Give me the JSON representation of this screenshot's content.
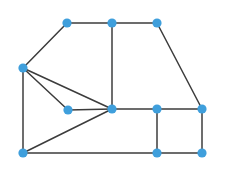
{
  "figure": {
    "background_color": "#ffffff",
    "width": 225,
    "height": 171
  },
  "style": {
    "node_color": "#3f9fdc",
    "node_radius": 4.6,
    "edge_color": "#3c3c3c",
    "edge_width": 1.5
  },
  "chart_data": {
    "type": "scatter",
    "xlabel": "",
    "ylabel": "",
    "grid": false,
    "legend": "none",
    "xlim": [
      0,
      225
    ],
    "ylim": [
      0,
      171
    ],
    "node_count": 11,
    "edge_count": 17,
    "nodes": [
      {
        "id": "n1",
        "label": "top-left",
        "x": 67,
        "y": 23
      },
      {
        "id": "n2",
        "label": "top-middle",
        "x": 112,
        "y": 23
      },
      {
        "id": "n3",
        "label": "top-right",
        "x": 157,
        "y": 23
      },
      {
        "id": "n4",
        "label": "left-apex",
        "x": 23,
        "y": 68
      },
      {
        "id": "n5",
        "label": "inner",
        "x": 68,
        "y": 110
      },
      {
        "id": "n6",
        "label": "center-hub",
        "x": 112,
        "y": 109
      },
      {
        "id": "n7",
        "label": "mid-right",
        "x": 157,
        "y": 109
      },
      {
        "id": "n8",
        "label": "far-right",
        "x": 202,
        "y": 109
      },
      {
        "id": "n9",
        "label": "bottom-left",
        "x": 23,
        "y": 153
      },
      {
        "id": "n10",
        "label": "bottom-middle",
        "x": 157,
        "y": 153
      },
      {
        "id": "n11",
        "label": "bottom-right",
        "x": 202,
        "y": 153
      }
    ],
    "edges": [
      {
        "source": "n1",
        "target": "n2",
        "x1": 67,
        "y1": 23,
        "x2": 112,
        "y2": 23
      },
      {
        "source": "n2",
        "target": "n3",
        "x1": 112,
        "y1": 23,
        "x2": 157,
        "y2": 23
      },
      {
        "source": "n1",
        "target": "n4",
        "x1": 67,
        "y1": 23,
        "x2": 23,
        "y2": 68
      },
      {
        "source": "n3",
        "target": "n8",
        "x1": 157,
        "y1": 23,
        "x2": 202,
        "y2": 109
      },
      {
        "source": "n2",
        "target": "n6",
        "x1": 112,
        "y1": 23,
        "x2": 112,
        "y2": 109
      },
      {
        "source": "n4",
        "target": "n5",
        "x1": 23,
        "y1": 68,
        "x2": 68,
        "y2": 110
      },
      {
        "source": "n4",
        "target": "n6",
        "x1": 23,
        "y1": 68,
        "x2": 112,
        "y2": 109
      },
      {
        "source": "n4",
        "target": "n9",
        "x1": 23,
        "y1": 68,
        "x2": 23,
        "y2": 153
      },
      {
        "source": "n5",
        "target": "n6",
        "x1": 68,
        "y1": 110,
        "x2": 112,
        "y2": 109
      },
      {
        "source": "n6",
        "target": "n7",
        "x1": 112,
        "y1": 109,
        "x2": 157,
        "y2": 109
      },
      {
        "source": "n6",
        "target": "n9",
        "x1": 112,
        "y1": 109,
        "x2": 23,
        "y2": 153
      },
      {
        "source": "n7",
        "target": "n8",
        "x1": 157,
        "y1": 109,
        "x2": 202,
        "y2": 109
      },
      {
        "source": "n7",
        "target": "n10",
        "x1": 157,
        "y1": 109,
        "x2": 157,
        "y2": 153
      },
      {
        "source": "n8",
        "target": "n11",
        "x1": 202,
        "y1": 109,
        "x2": 202,
        "y2": 153
      },
      {
        "source": "n9",
        "target": "n10",
        "x1": 23,
        "y1": 153,
        "x2": 157,
        "y2": 153
      },
      {
        "source": "n10",
        "target": "n11",
        "x1": 157,
        "y1": 153,
        "x2": 202,
        "y2": 153
      }
    ]
  }
}
